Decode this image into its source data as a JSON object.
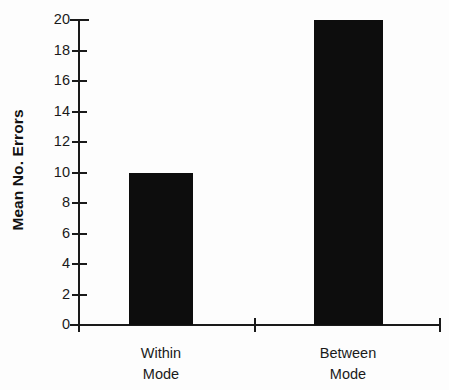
{
  "chart_data": {
    "type": "bar",
    "title": "",
    "subtitle": "",
    "xlabel": "",
    "ylabel": "Mean No. Errors",
    "categories": [
      "Within Mode",
      "Between Mode"
    ],
    "category_lines": [
      [
        "Within",
        "Mode"
      ],
      [
        "Between",
        "Mode"
      ]
    ],
    "values": [
      10,
      20
    ],
    "ylim": [
      0,
      20
    ],
    "ytick_values": [
      0,
      2,
      4,
      6,
      8,
      10,
      12,
      14,
      16,
      18,
      20
    ],
    "ytick_labels": [
      "0",
      "2",
      "4",
      "6",
      "8",
      "10",
      "12",
      "14",
      "16",
      "18",
      "20"
    ],
    "grid": false,
    "legend": null,
    "legend_position": "none",
    "bar_color": "#0d0d0d",
    "axis_color": "#1a1a1a",
    "background_color": "#fdfdfd",
    "annotations": []
  },
  "axes": {
    "y_title": "Mean No. Errors"
  }
}
